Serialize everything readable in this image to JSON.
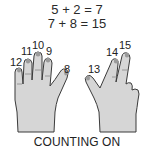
{
  "equations": [
    "5 + 2 = 7",
    "7 + 8 = 15"
  ],
  "left_hand": {
    "labels": {
      "pinky": "12",
      "ring": "11",
      "middle": "10",
      "index": "9",
      "thumb": "8"
    }
  },
  "right_hand": {
    "labels": {
      "thumb": "13",
      "index": "14",
      "middle": "15"
    }
  },
  "caption": "COUNTING ON",
  "colors": {
    "skin": "#d6d6d6",
    "outline": "#3a3a3a",
    "nail": "#9a9a9a",
    "text": "#222222"
  }
}
